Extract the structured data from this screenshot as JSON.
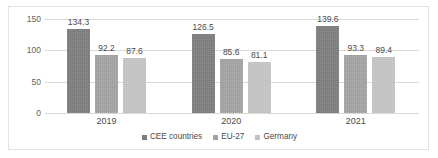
{
  "chart_data": {
    "type": "bar",
    "title": "",
    "subtitle": "",
    "xlabel": "",
    "ylabel": "",
    "categories": [
      "2019",
      "2020",
      "2021"
    ],
    "series": [
      {
        "name": "CEE countries",
        "color": "#7d7d7d",
        "values": [
          134.3,
          126.5,
          139.6
        ]
      },
      {
        "name": "EU-27",
        "color": "#a1a1a1",
        "values": [
          92.2,
          85.6,
          93.3
        ]
      },
      {
        "name": "Germany",
        "color": "#c2c2c2",
        "values": [
          87.6,
          81.1,
          89.4
        ]
      }
    ],
    "ylim": [
      0,
      150
    ],
    "yticks": [
      0,
      50,
      100,
      150
    ],
    "ytick_labels": [
      "0",
      "50",
      "100",
      "150"
    ],
    "grid": true,
    "grid_axis": "y",
    "legend_position": "bottom",
    "data_labels": true,
    "border_color": "#e3e3e3",
    "gridline_color": "#d9d9d9",
    "text_color": "#4a4a4a"
  },
  "legend": {
    "items": [
      {
        "label": "CEE countries"
      },
      {
        "label": "EU-27"
      },
      {
        "label": "Germany"
      }
    ]
  },
  "axis": {
    "y_labels": [
      "150",
      "100",
      "50",
      "0"
    ],
    "x_labels": [
      "2019",
      "2020",
      "2021"
    ]
  }
}
